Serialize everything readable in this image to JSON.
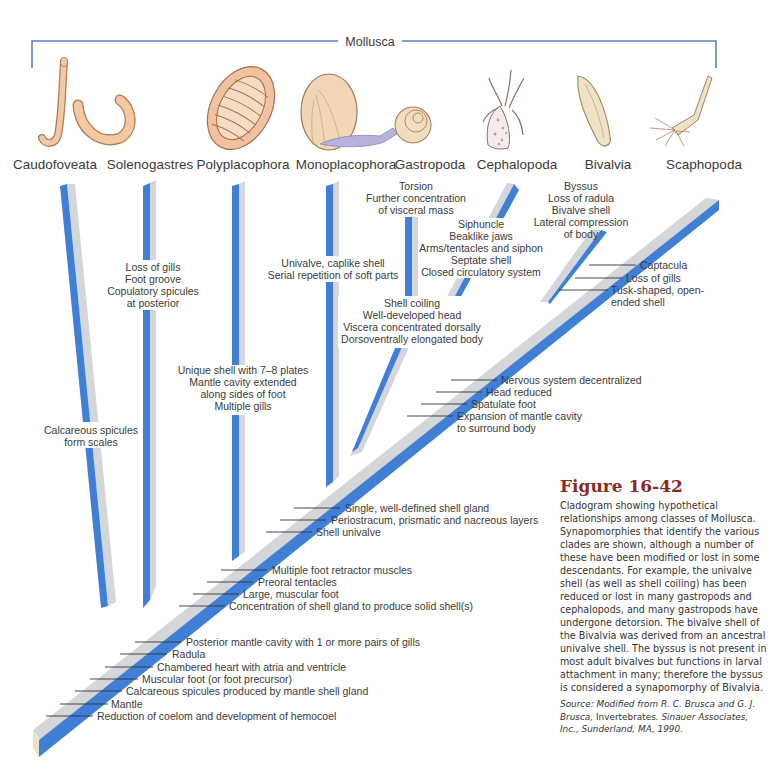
{
  "figure": {
    "clade_label": "Mollusca",
    "title": "Figure 16-42",
    "caption": "Cladogram showing hypothetical relationships among classes of Mollusca. Synapomorphies that identify the various clades are shown, although a number of these have been modified or lost in some descendants. For example, the univalve shell (as well as shell coiling) has been reduced or lost in many gastropods and cephalopods, and many gastropods have undergone detorsion. The bivalve shell of the Bivalvia was derived from an ancestral univalve shell. The byssus is not present in most adult bivalves but functions in larval attachment in many; therefore the byssus is considered a synapomorphy of Bivalvia.",
    "source_prefix": "Source: Modified from R. C. Brusca and G. J. Brusca, ",
    "source_book": "Invertebrates",
    "source_suffix": ". Sinauer Associates, Inc., Sunderland, MA, 1990."
  },
  "colors": {
    "branch_blue": "#3f7fd6",
    "branch_gray": "#d4d6da",
    "text": "#3a3a3a",
    "title_red": "#8b2a22",
    "bracket_blue": "#5b7fc4"
  },
  "taxa": [
    {
      "name": "Caudofoveata",
      "icon": "worm-hook-icon"
    },
    {
      "name": "Solenogastres",
      "icon": "worm-curl-icon"
    },
    {
      "name": "Polyplacophora",
      "icon": "chiton-icon"
    },
    {
      "name": "Monoplacophora",
      "icon": "limpet-shell-icon"
    },
    {
      "name": "Gastropoda",
      "icon": "snail-icon"
    },
    {
      "name": "Cephalopoda",
      "icon": "squid-icon"
    },
    {
      "name": "Bivalvia",
      "icon": "clam-icon"
    },
    {
      "name": "Scaphopoda",
      "icon": "tusk-shell-icon"
    }
  ],
  "branch_traits": {
    "caudofoveata": [
      "Calcareous spicules",
      "form scales"
    ],
    "solenogastres": [
      "Loss of gills",
      "Foot groove",
      "Copulatory spicules",
      "at posterior"
    ],
    "polyplacophora": [
      "Unique shell with 7–8 plates",
      "Mantle cavity extended",
      "along sides of foot",
      "Multiple gills"
    ],
    "monoplacophora": [
      "Univalve, caplike shell",
      "Serial repetition of soft parts"
    ],
    "gastropoda": [
      "Torsion",
      "Further concentration",
      "of visceral mass"
    ],
    "cephalopoda": [
      "Siphuncle",
      "Beaklike jaws",
      "Arms/tentacles and siphon",
      "Septate shell",
      "Closed circulatory system"
    ],
    "gastropoda_cephalopoda": [
      "Shell coiling",
      "Well-developed head",
      "Viscera concentrated dorsally",
      "Dorsoventrally elongated body"
    ],
    "bivalvia": [
      "Byssus",
      "Loss of radula",
      "Bivalve shell",
      "Lateral compression",
      "of body"
    ]
  },
  "node_traits": {
    "scaphopoda": [
      "Captacula",
      "Loss of gills",
      "Tusk-shaped, open-",
      "ended shell"
    ],
    "bivalvia_scaphopoda": [
      "Nervous system decentralized",
      "Head reduced",
      "Spatulate foot",
      "Expansion of mantle cavity",
      "to surround body"
    ],
    "conchifera_upper": [
      "Single, well-defined shell gland",
      "Periostracum, prismatic and nacreous layers",
      "Shell univalve"
    ],
    "polyplacophora_conchifera": [
      "Multiple foot retractor muscles",
      "Preoral tentacles",
      "Large, muscular foot",
      "Concentration of shell gland to produce solid shell(s)"
    ],
    "base": [
      "Posterior mantle cavity with 1 or more pairs of gills",
      "Radula",
      "Chambered heart with atria and ventricle",
      "Muscular foot (or foot precursor)",
      "Calcareous spicules produced by mantle shell gland",
      "Mantle",
      "Reduction of coelom and development of hemocoel"
    ]
  }
}
